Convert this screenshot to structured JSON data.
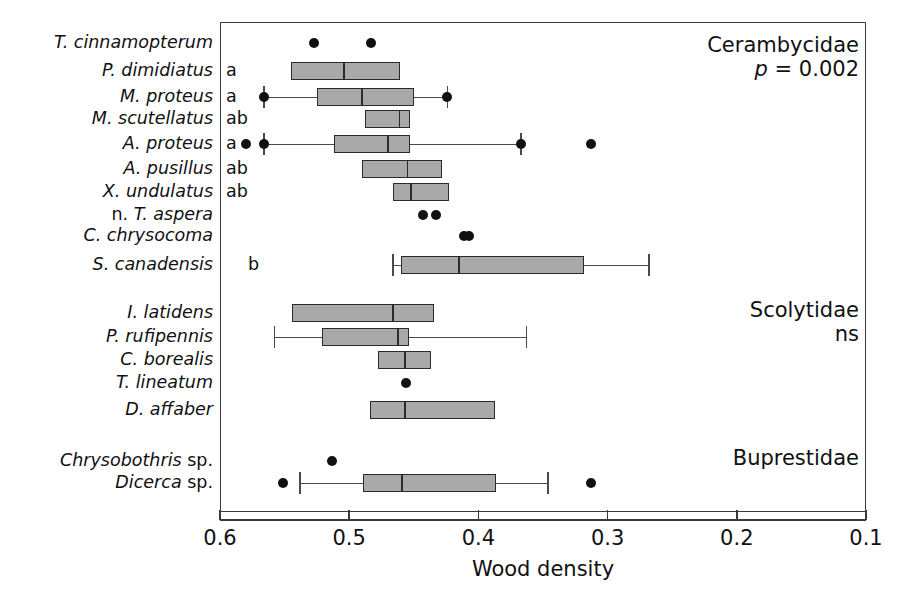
{
  "chart_data": {
    "type": "box",
    "title": "",
    "xlabel": "Wood density",
    "ylabel": "",
    "xlim": [
      0.6,
      0.1
    ],
    "x_axis_reversed": true,
    "xticks": [
      "0.6",
      "0.5",
      "0.4",
      "0.3",
      "0.2",
      "0.1"
    ],
    "xtick_values": [
      0.6,
      0.5,
      0.4,
      0.3,
      0.2,
      0.1
    ],
    "grid": false,
    "legend": "none",
    "box_fill_color": "#a9a9a9",
    "box_edge_color": "#2b2b2b",
    "outlier_color": "#111111",
    "groups": [
      {
        "family": "Cerambycidae",
        "significance": "p = 0.002",
        "significance_prefix_italic": "p",
        "rows": [
          {
            "label_italic": "T. cinnamopterum",
            "label_roman": "",
            "sig": "",
            "box": null,
            "whiskers": null,
            "outliers": [
              0.527,
              0.483
            ]
          },
          {
            "label_italic": "P. dimidiatus",
            "label_roman": "",
            "sig": "a",
            "box": {
              "q1": 0.545,
              "median": 0.504,
              "q3": 0.461
            },
            "whiskers": null,
            "outliers": []
          },
          {
            "label_italic": "M. proteus",
            "label_roman": "",
            "sig": "a",
            "box": {
              "q1": 0.525,
              "median": 0.49,
              "q3": 0.45
            },
            "whiskers": {
              "low": 0.566,
              "high": 0.424
            },
            "outliers": [
              0.566,
              0.424
            ]
          },
          {
            "label_italic": "M. scutellatus",
            "label_roman": "",
            "sig": "ab",
            "box": {
              "q1": 0.488,
              "median": 0.461,
              "q3": 0.453
            },
            "whiskers": null,
            "outliers": []
          },
          {
            "label_italic": "A. proteus",
            "label_roman": "",
            "sig": "a",
            "box": {
              "q1": 0.512,
              "median": 0.47,
              "q3": 0.453
            },
            "whiskers": {
              "low": 0.566,
              "high": 0.367
            },
            "outliers": [
              0.58,
              0.566,
              0.367,
              0.313
            ]
          },
          {
            "label_italic": "A. pusillus",
            "label_roman": "",
            "sig": "ab",
            "box": {
              "q1": 0.49,
              "median": 0.455,
              "q3": 0.428
            },
            "whiskers": null,
            "outliers": []
          },
          {
            "label_italic": "X. undulatus",
            "label_roman": "",
            "sig": "ab",
            "box": {
              "q1": 0.466,
              "median": 0.452,
              "q3": 0.423
            },
            "whiskers": null,
            "outliers": []
          },
          {
            "label_italic": "T. aspera",
            "label_roman": "n. ",
            "sig": "",
            "box": null,
            "whiskers": null,
            "outliers": [
              0.443,
              0.433
            ]
          },
          {
            "label_italic": "C. chrysocoma",
            "label_roman": "",
            "sig": "",
            "box": null,
            "whiskers": null,
            "outliers": [
              0.411,
              0.407
            ]
          },
          {
            "label_italic": "S. canadensis",
            "label_roman": "",
            "sig": "b",
            "box": {
              "q1": 0.46,
              "median": 0.415,
              "q3": 0.318
            },
            "whiskers": {
              "low": 0.466,
              "high": 0.268
            },
            "outliers": []
          }
        ]
      },
      {
        "family": "Scolytidae",
        "significance": "ns",
        "significance_prefix_italic": "",
        "rows": [
          {
            "label_italic": "I. latidens",
            "label_roman": "",
            "sig": "",
            "box": {
              "q1": 0.544,
              "median": 0.466,
              "q3": 0.434
            },
            "whiskers": null,
            "outliers": []
          },
          {
            "label_italic": "P. rufipennis",
            "label_roman": "",
            "sig": "",
            "box": {
              "q1": 0.521,
              "median": 0.462,
              "q3": 0.454
            },
            "whiskers": {
              "low": 0.558,
              "high": 0.363
            },
            "outliers": []
          },
          {
            "label_italic": "C. borealis",
            "label_roman": "",
            "sig": "",
            "box": {
              "q1": 0.478,
              "median": 0.457,
              "q3": 0.437
            },
            "whiskers": null,
            "outliers": []
          },
          {
            "label_italic": "T. lineatum",
            "label_roman": "",
            "sig": "",
            "box": null,
            "whiskers": null,
            "outliers": [
              0.456
            ]
          },
          {
            "label_italic": "D. affaber",
            "label_roman": "",
            "sig": "",
            "box": {
              "q1": 0.484,
              "median": 0.457,
              "q3": 0.387
            },
            "whiskers": null,
            "outliers": []
          }
        ]
      },
      {
        "family": "Buprestidae",
        "significance": "",
        "significance_prefix_italic": "",
        "rows": [
          {
            "label_italic": "Chrysobothris",
            "label_roman": " sp.",
            "sig": "",
            "box": null,
            "whiskers": null,
            "outliers": [
              0.513
            ]
          },
          {
            "label_italic": "Dicerca",
            "label_roman": " sp.",
            "sig": "",
            "box": {
              "q1": 0.489,
              "median": 0.459,
              "q3": 0.386
            },
            "whiskers": {
              "low": 0.538,
              "high": 0.346
            },
            "outliers": [
              0.551,
              0.313
            ]
          }
        ]
      }
    ]
  }
}
